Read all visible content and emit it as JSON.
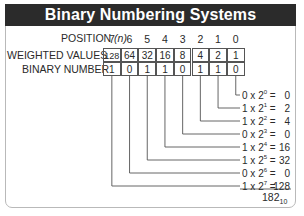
{
  "title": "Binary Numbering Systems",
  "row_labels": {
    "position": "POSITION",
    "position_var": "(n)",
    "weighted": "WEIGHTED VALUES",
    "binary": "BINARY NUMBER"
  },
  "positions": [
    "7",
    "6",
    "5",
    "4",
    "3",
    "2",
    "1",
    "0"
  ],
  "weighted_values": [
    "128",
    "64",
    "32",
    "16",
    "8",
    "4",
    "2",
    "1"
  ],
  "binary_digits": [
    "1",
    "0",
    "1",
    "1",
    "0",
    "1",
    "1",
    "0"
  ],
  "results": [
    {
      "bit": "0",
      "base": "2",
      "exp": "0",
      "value": "0"
    },
    {
      "bit": "1",
      "base": "2",
      "exp": "1",
      "value": "2"
    },
    {
      "bit": "1",
      "base": "2",
      "exp": "2",
      "value": "4"
    },
    {
      "bit": "0",
      "base": "2",
      "exp": "3",
      "value": "0"
    },
    {
      "bit": "1",
      "base": "2",
      "exp": "4",
      "value": "16"
    },
    {
      "bit": "1",
      "base": "2",
      "exp": "5",
      "value": "32"
    },
    {
      "bit": "0",
      "base": "2",
      "exp": "6",
      "value": "0"
    },
    {
      "bit": "1",
      "base": "2",
      "exp": "7",
      "value": "128"
    }
  ],
  "total": {
    "value": "182",
    "base": "10"
  },
  "colors": {
    "title_bg": "#2b2b2b",
    "title_fg": "#ffffff",
    "line": "#555555",
    "frame": "#b9b9b9"
  }
}
